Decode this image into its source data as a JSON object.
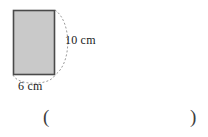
{
  "figure": {
    "type": "geometry-diagram",
    "background_color": "#ffffff",
    "rectangle": {
      "fill_color": "#c9c9c9",
      "stroke_color": "#4a4a4a",
      "x": 13,
      "y": 10,
      "width": 42,
      "height": 65
    },
    "arcs": {
      "stroke_color": "#9a9a9a",
      "dash_pattern": "2 2",
      "side_arc_label": "vertical-rotation-arc",
      "base_arc_label": "base-ellipse-arc"
    },
    "labels": {
      "height": "10 cm",
      "width": "6 cm"
    }
  },
  "answer": {
    "open_paren": "(",
    "close_paren": ")",
    "value": ""
  }
}
